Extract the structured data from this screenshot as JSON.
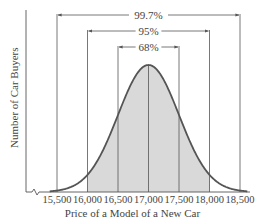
{
  "chart_data": {
    "type": "area",
    "title": "",
    "xlabel": "Price of a Model of a New Car",
    "ylabel": "Number of Car Buyers",
    "distribution": "normal",
    "mean": 17000,
    "std_dev": 500,
    "x_ticks": [
      15500,
      16000,
      16500,
      17000,
      17500,
      18000,
      18500
    ],
    "x_tick_labels": [
      "15,500",
      "16,000",
      "16,500",
      "17,000",
      "17,500",
      "18,000",
      "18,500"
    ],
    "xlim": [
      15000,
      19000
    ],
    "grid": false,
    "axis_break": true,
    "intervals": [
      {
        "label": "68%",
        "from": 16500,
        "to": 17500
      },
      {
        "label": "95%",
        "from": 16000,
        "to": 18000
      },
      {
        "label": "99.7%",
        "from": 15500,
        "to": 18500
      }
    ],
    "shaded_region": [
      16000,
      18000
    ]
  },
  "colors": {
    "curve": "#555555",
    "fill": "#d9d9d9",
    "lines": "#555555",
    "text": "#444444"
  }
}
